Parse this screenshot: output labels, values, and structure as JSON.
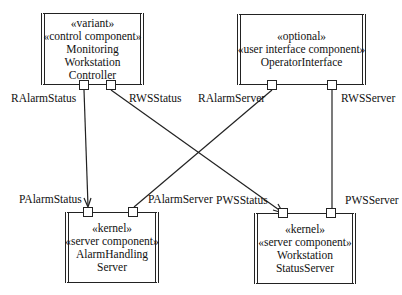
{
  "components": {
    "monitoring": {
      "stereotypes": [
        "«variant»",
        "«control component»"
      ],
      "name_lines": [
        "Monitoring",
        "Workstation",
        "Controller"
      ]
    },
    "operator": {
      "stereotypes": [
        "«optional»",
        "«user interface component»"
      ],
      "name_lines": [
        "OperatorInterface"
      ]
    },
    "alarm": {
      "stereotypes": [
        "«kernel»",
        "«server component»"
      ],
      "name_lines": [
        "AlarmHandling",
        "Server"
      ]
    },
    "wsstatus": {
      "stereotypes": [
        "«kernel»",
        "«server component»"
      ],
      "name_lines": [
        "Workstation",
        "StatusServer"
      ]
    }
  },
  "ports": {
    "ralarmstatus": "RAlarmStatus",
    "rwsstatus": "RWSStatus",
    "ralarmserver": "RAlarmServer",
    "rwsserver": "RWSServer",
    "palarmstatus": "PAlarmStatus",
    "palarmserver": "PAlarmServer",
    "pwsstatus": "PWSStatus",
    "pwsserver": "PWSServer"
  },
  "connectors": [
    {
      "from": "RAlarmStatus",
      "to": "PAlarmStatus",
      "arrow": true
    },
    {
      "from": "RWSStatus",
      "to": "PWSStatus",
      "arrow": true
    },
    {
      "from": "RAlarmServer",
      "to": "PAlarmServer",
      "arrow": false
    },
    {
      "from": "RWSServer",
      "to": "PWSServer",
      "arrow": false
    }
  ]
}
